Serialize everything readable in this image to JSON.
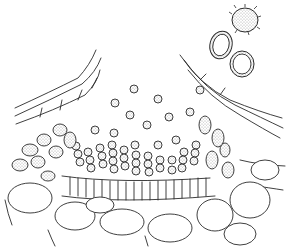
{
  "figure": {
    "type": "botanical line drawing",
    "stroke_color": "#2a2a2a",
    "background_color": "#ffffff"
  }
}
